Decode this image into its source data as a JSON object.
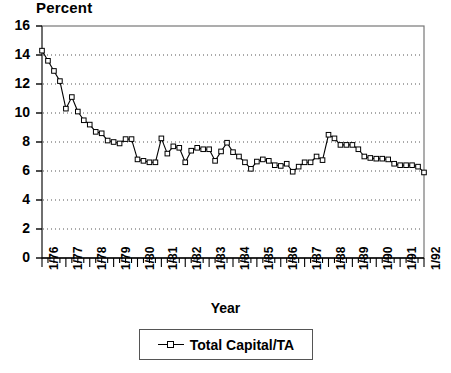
{
  "chart_data": {
    "type": "line",
    "title": "",
    "ylabel": "Percent",
    "xlabel": "Year",
    "ylim": [
      0,
      16
    ],
    "yticks": [
      0,
      2,
      4,
      6,
      8,
      10,
      12,
      14,
      16
    ],
    "xlim": [
      "1/76",
      "1/92"
    ],
    "xtick_labels": [
      "1/76",
      "1/77",
      "1/78",
      "1/79",
      "1/80",
      "1/81",
      "1/82",
      "1/83",
      "1/84",
      "1/85",
      "1/86",
      "1/87",
      "1/88",
      "1/89",
      "1/90",
      "1/91",
      "1/92"
    ],
    "grid": "horizontal-dotted",
    "legend_position": "below-plot",
    "marker": "open-square",
    "line_color": "#000000",
    "series": [
      {
        "name": "Total Capital/TA",
        "x": [
          "1/76",
          "2/76",
          "3/76",
          "4/76",
          "1/77",
          "2/77",
          "3/77",
          "4/77",
          "1/78",
          "2/78",
          "3/78",
          "4/78",
          "1/79",
          "2/79",
          "3/79",
          "4/79",
          "1/80",
          "2/80",
          "3/80",
          "4/80",
          "1/81",
          "2/81",
          "3/81",
          "4/81",
          "1/82",
          "2/82",
          "3/82",
          "4/82",
          "1/83",
          "2/83",
          "3/83",
          "4/83",
          "1/84",
          "2/84",
          "3/84",
          "4/84",
          "1/85",
          "2/85",
          "3/85",
          "4/85",
          "1/86",
          "2/86",
          "3/86",
          "4/86",
          "1/87",
          "2/87",
          "3/87",
          "4/87",
          "1/88",
          "2/88",
          "3/88",
          "4/88",
          "1/89",
          "2/89",
          "3/89",
          "4/89",
          "1/90",
          "2/90",
          "3/90",
          "4/90",
          "1/91",
          "2/91",
          "3/91",
          "4/91",
          "1/92"
        ],
        "values": [
          14.3,
          13.6,
          12.9,
          12.2,
          10.3,
          11.1,
          10.1,
          9.5,
          9.2,
          8.7,
          8.6,
          8.1,
          8.0,
          7.9,
          8.2,
          8.2,
          6.8,
          6.7,
          6.6,
          6.6,
          8.25,
          7.2,
          7.7,
          7.6,
          6.6,
          7.4,
          7.6,
          7.5,
          7.5,
          6.7,
          7.35,
          7.95,
          7.3,
          7.0,
          6.6,
          6.15,
          6.65,
          6.8,
          6.7,
          6.4,
          6.35,
          6.5,
          5.95,
          6.3,
          6.6,
          6.6,
          7.0,
          6.75,
          8.5,
          8.25,
          7.8,
          7.8,
          7.8,
          7.5,
          7.0,
          6.9,
          6.85,
          6.85,
          6.8,
          6.5,
          6.4,
          6.4,
          6.4,
          6.3,
          5.9
        ]
      }
    ]
  },
  "legend": {
    "label": "Total Capital/TA"
  }
}
